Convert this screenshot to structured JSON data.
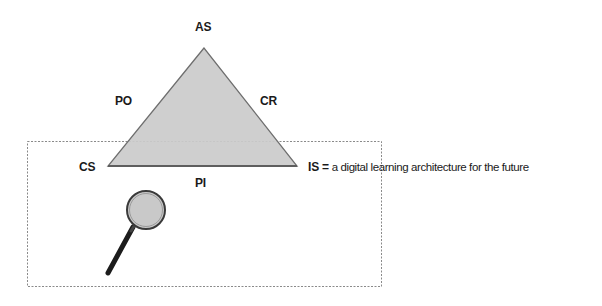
{
  "diagram": {
    "type": "triangle-model",
    "vertices": {
      "top": "AS",
      "bottom_left": "CS",
      "bottom_right": "IS"
    },
    "edges": {
      "left": "PO",
      "right": "CR",
      "bottom": "PI"
    },
    "definition": {
      "term": "IS =",
      "text": "a digital learning architecture for the future"
    },
    "icons": {
      "magnifier": "magnifying-glass-icon"
    },
    "colors": {
      "triangle_fill": "#cbcbcb",
      "triangle_stroke": "#6e6e6e",
      "dotted_box": "#8a8a8a",
      "text": "#1a1a1a"
    }
  }
}
